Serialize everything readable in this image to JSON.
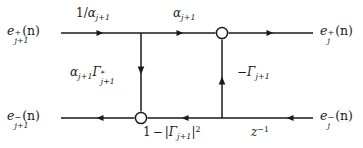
{
  "figure": {
    "kind": "signal-flow-graph",
    "title_text": "",
    "stroke_color": "#1a1a1a",
    "background_color": "#ffffff",
    "node_fill": "#ffffff"
  },
  "ports": {
    "top_left": {
      "base": "e",
      "superscript": "+",
      "subscript": "j+1",
      "argument": "(n)",
      "full_text": "e+j+1(n)"
    },
    "top_right": {
      "base": "e",
      "superscript": "+",
      "subscript": "j",
      "argument": "(n)",
      "full_text": "e+j(n)"
    },
    "bottom_left": {
      "base": "e",
      "superscript": "−",
      "subscript": "j+1",
      "argument": "(n)",
      "full_text": "e−j+1(n)"
    },
    "bottom_right": {
      "base": "e",
      "superscript": "−",
      "subscript": "j",
      "argument": "(n)",
      "full_text": "e−j(n)"
    }
  },
  "gains": {
    "top_left_branch": {
      "numerator": "1/",
      "symbol": "α",
      "subscript": "j+1",
      "full_text": "1/αj+1"
    },
    "top_right_branch": {
      "symbol": "α",
      "subscript": "j+1",
      "full_text": "αj+1"
    },
    "cross_down_branch": {
      "symbol_a": "α",
      "subscript_a": "j+1",
      "symbol_b": "Γ",
      "superscript_b": "*",
      "subscript_b": "j+1",
      "full_text": "αj+1Γ*j+1"
    },
    "cross_up_branch": {
      "sign": "−",
      "symbol": "Γ",
      "subscript": "j+1",
      "full_text": "−Γj+1"
    },
    "bottom_left_branch": {
      "lead": "1",
      "operator": "−",
      "bar_open": "|",
      "symbol": "Γ",
      "subscript": "j+1",
      "bar_close": "|",
      "exponent": "2",
      "full_text": "1 − |Γj+1|²"
    },
    "bottom_right_branch": {
      "symbol": "z",
      "exponent": "−1",
      "full_text": "z−1"
    }
  },
  "nodes": [
    {
      "id": "sum-top-right",
      "shape": "open-circle",
      "x": 222,
      "y": 33
    },
    {
      "id": "sum-bottom-left",
      "shape": "open-circle",
      "x": 141,
      "y": 118
    }
  ]
}
